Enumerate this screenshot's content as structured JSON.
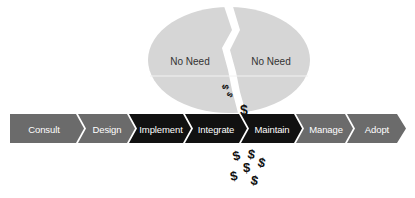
{
  "bubble": {
    "left_label": "No Need",
    "right_label": "No Need",
    "fill": "#d6d6d6"
  },
  "process": {
    "steps": [
      {
        "label": "Consult",
        "fill": "#6b6b6b"
      },
      {
        "label": "Design",
        "fill": "#6b6b6b"
      },
      {
        "label": "Implement",
        "fill": "#111111"
      },
      {
        "label": "Integrate",
        "fill": "#111111"
      },
      {
        "label": "Maintain",
        "fill": "#111111"
      },
      {
        "label": "Manage",
        "fill": "#6b6b6b"
      },
      {
        "label": "Adopt",
        "fill": "#6b6b6b"
      }
    ]
  },
  "money_symbol": "$",
  "colors": {
    "light_step": "#6b6b6b",
    "dark_step": "#111111",
    "bubble": "#d6d6d6",
    "text_light": "#ffffff"
  }
}
